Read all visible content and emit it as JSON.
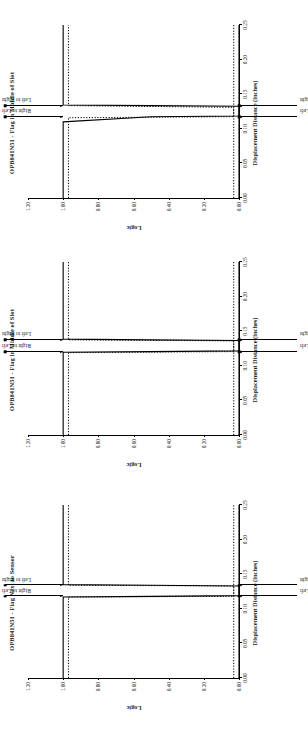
{
  "figure": {
    "background": "#ffffff",
    "ink": "#000000",
    "orientation": "rotated-90-ccw"
  },
  "charts": [
    {
      "id": "chart-1",
      "title": "OPB841N51 - Flag in Middle of Slot",
      "chart_data": {
        "type": "line",
        "title": "OPB841N51 - Flag in Middle of Slot",
        "xlabel": "Displacement Distance (inches)",
        "ylabel": "Logic",
        "xlim": [
          0.0,
          0.25
        ],
        "ylim": [
          0.0,
          1.2
        ],
        "xticks": [
          "0.00",
          "0.05",
          "0.10",
          "0.15",
          "0.20",
          "0.25"
        ],
        "yticks": [
          "0.00",
          "0.20",
          "0.40",
          "0.60",
          "0.80",
          "1.00",
          "1.20"
        ],
        "grid": false,
        "legend": "none",
        "annotations": [
          {
            "label": "Right to Left",
            "x": 0.1175,
            "y": 1.0
          },
          {
            "label": "Left to Right",
            "x": 0.1335,
            "y": 1.0
          },
          {
            "label": "Right to Left",
            "x": 0.1175,
            "y": 0.0
          },
          {
            "label": "Left to Right",
            "x": 0.1335,
            "y": 0.0
          }
        ],
        "series": [
          {
            "name": "Right to Left",
            "style": "solid",
            "points": [
              [
                0.0,
                1.0
              ],
              [
                0.11,
                1.0
              ],
              [
                0.1175,
                0.5
              ],
              [
                0.1185,
                0.0
              ],
              [
                0.25,
                0.0
              ]
            ]
          },
          {
            "name": "Left to Right",
            "style": "solid",
            "points": [
              [
                0.0,
                0.0
              ],
              [
                0.1325,
                0.0
              ],
              [
                0.1335,
                0.5
              ],
              [
                0.1345,
                1.0
              ],
              [
                0.25,
                1.0
              ]
            ]
          },
          {
            "name": "Right to Left (dotted overlay)",
            "style": "dotted",
            "points": [
              [
                0.0,
                0.97
              ],
              [
                0.116,
                0.97
              ],
              [
                0.1175,
                0.03
              ],
              [
                0.25,
                0.03
              ]
            ]
          },
          {
            "name": "Left to Right (dotted overlay)",
            "style": "dotted",
            "points": [
              [
                0.0,
                0.03
              ],
              [
                0.131,
                0.03
              ],
              [
                0.1335,
                0.97
              ],
              [
                0.25,
                0.97
              ]
            ]
          }
        ]
      }
    },
    {
      "id": "chart-2",
      "title": "OPB841N51 - Flag in Middle of Slot",
      "chart_data": {
        "type": "line",
        "title": "OPB841N51 - Flag in Middle of Slot",
        "xlabel": "Displacement Distance (inches)",
        "ylabel": "Logic",
        "xlim": [
          0.0,
          0.25
        ],
        "ylim": [
          0.0,
          1.2
        ],
        "xticks": [
          "0.00",
          "0.05",
          "0.10",
          "0.15",
          "0.20",
          "0.25"
        ],
        "yticks": [
          "0.00",
          "0.20",
          "0.40",
          "0.60",
          "0.80",
          "1.00",
          "1.20"
        ],
        "grid": false,
        "legend": "none",
        "annotations": [
          {
            "label": "Right to Left",
            "x": 0.1205,
            "y": 1.0
          },
          {
            "label": "Left to Right",
            "x": 0.1375,
            "y": 1.0
          },
          {
            "label": "Right to Left",
            "x": 0.1205,
            "y": 0.0
          },
          {
            "label": "Left to Right",
            "x": 0.1375,
            "y": 0.0
          }
        ],
        "series": [
          {
            "name": "Right to Left",
            "style": "solid",
            "points": [
              [
                0.0,
                1.0
              ],
              [
                0.1195,
                1.0
              ],
              [
                0.1205,
                0.5
              ],
              [
                0.1215,
                0.0
              ],
              [
                0.25,
                0.0
              ]
            ]
          },
          {
            "name": "Left to Right",
            "style": "solid",
            "points": [
              [
                0.0,
                0.0
              ],
              [
                0.1365,
                0.0
              ],
              [
                0.1375,
                0.5
              ],
              [
                0.1385,
                1.0
              ],
              [
                0.25,
                1.0
              ]
            ]
          },
          {
            "name": "Right to Left (dotted overlay)",
            "style": "dotted",
            "points": [
              [
                0.0,
                0.97
              ],
              [
                0.119,
                0.97
              ],
              [
                0.1205,
                0.03
              ],
              [
                0.25,
                0.03
              ]
            ]
          },
          {
            "name": "Left to Right (dotted overlay)",
            "style": "dotted",
            "points": [
              [
                0.0,
                0.03
              ],
              [
                0.136,
                0.03
              ],
              [
                0.1375,
                0.97
              ],
              [
                0.25,
                0.97
              ]
            ]
          }
        ]
      }
    },
    {
      "id": "chart-3",
      "title": "OPB841N51 - Flag Next to Sensor",
      "chart_data": {
        "type": "line",
        "title": "OPB841N51 - Flag Next to Sensor",
        "xlabel": "Displacement Distance (inches)",
        "ylabel": "Logic",
        "xlim": [
          0.0,
          0.25
        ],
        "ylim": [
          0.0,
          1.2
        ],
        "xticks": [
          "0.00",
          "0.05",
          "0.10",
          "0.15",
          "0.20",
          "0.25"
        ],
        "yticks": [
          "0.00",
          "0.20",
          "0.40",
          "0.60",
          "0.80",
          "1.00",
          "1.20"
        ],
        "grid": false,
        "legend": "none",
        "annotations": [
          {
            "label": "Right to Left",
            "x": 0.118,
            "y": 1.0
          },
          {
            "label": "Left to Right",
            "x": 0.134,
            "y": 1.0
          },
          {
            "label": "Right to Left",
            "x": 0.118,
            "y": 0.0
          },
          {
            "label": "Left to Right",
            "x": 0.134,
            "y": 0.0
          }
        ],
        "series": [
          {
            "name": "Right to Left",
            "style": "solid",
            "points": [
              [
                0.0,
                1.0
              ],
              [
                0.117,
                1.0
              ],
              [
                0.118,
                0.5
              ],
              [
                0.119,
                0.0
              ],
              [
                0.25,
                0.0
              ]
            ]
          },
          {
            "name": "Left to Right",
            "style": "solid",
            "points": [
              [
                0.0,
                0.0
              ],
              [
                0.133,
                0.0
              ],
              [
                0.134,
                0.5
              ],
              [
                0.135,
                1.0
              ],
              [
                0.25,
                1.0
              ]
            ]
          },
          {
            "name": "Right to Left (dotted overlay)",
            "style": "dotted",
            "points": [
              [
                0.0,
                0.97
              ],
              [
                0.117,
                0.97
              ],
              [
                0.118,
                0.03
              ],
              [
                0.25,
                0.03
              ]
            ]
          },
          {
            "name": "Left to Right (dotted overlay)",
            "style": "dotted",
            "points": [
              [
                0.0,
                0.03
              ],
              [
                0.133,
                0.03
              ],
              [
                0.134,
                0.97
              ],
              [
                0.25,
                0.97
              ]
            ]
          }
        ]
      }
    }
  ]
}
